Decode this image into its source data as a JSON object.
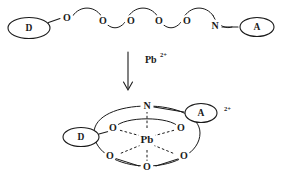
{
  "figure": {
    "domain": "chemical-reaction-scheme",
    "background_color": "#ffffff",
    "ink_color": "#1a1a1a",
    "width": 283,
    "height": 188
  },
  "reactant": {
    "name": "open-chain-podand",
    "donor_label": "D",
    "acceptor_label": "A",
    "nitrogen_label": "N",
    "oxygen_labels": [
      "O",
      "O",
      "O",
      "O",
      "O"
    ]
  },
  "arrow": {
    "direction": "down",
    "reagent_symbol": "Pb",
    "reagent_charge": "2+"
  },
  "product": {
    "name": "lead-podand-complex",
    "donor_label": "D",
    "acceptor_label": "A",
    "nitrogen_label": "N",
    "metal_label": "Pb",
    "complex_charge": "2+",
    "oxygen_labels": [
      "O",
      "O",
      "O",
      "O",
      "O"
    ]
  }
}
